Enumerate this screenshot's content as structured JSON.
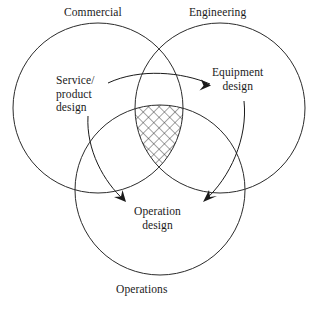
{
  "figure": {
    "type": "venn-diagram",
    "set_count": 3,
    "background_color": "#ffffff",
    "line_color": "#2b2b2b"
  },
  "circles": [
    {
      "id": "commercial",
      "label": "Commercial",
      "cx": 98,
      "cy": 108,
      "r": 85,
      "label_position": "top-left"
    },
    {
      "id": "engineering",
      "label": "Engineering",
      "cx": 220,
      "cy": 108,
      "r": 85,
      "label_position": "top-right"
    },
    {
      "id": "operations",
      "label": "Operations",
      "cx": 160,
      "cy": 190,
      "r": 85,
      "label_position": "bottom"
    }
  ],
  "labels": {
    "commercial": "Commercial",
    "engineering": "Engineering",
    "operations": "Operations"
  },
  "callouts": [
    {
      "id": "service-product-design",
      "lines": [
        "Service/",
        "product",
        "design"
      ],
      "line1": "Service/",
      "line2": "product",
      "line3": "design"
    },
    {
      "id": "equipment-design",
      "lines": [
        "Equipment",
        "design"
      ],
      "line1": "Equipment",
      "line2": "design"
    },
    {
      "id": "operation-design",
      "lines": [
        "Operation",
        "design"
      ],
      "line1": "Operation",
      "line2": "design"
    }
  ],
  "arrows": [
    {
      "id": "arrow-to-equipment-design",
      "from": "service-product-design-label",
      "to": "equipment-design-label",
      "direction": "right"
    },
    {
      "id": "arrow-service-to-operation-design",
      "from": "service-product-design-label",
      "to": "operation-design-label",
      "direction": "down-right"
    },
    {
      "id": "arrow-equipment-to-operation-design",
      "from": "equipment-design-label",
      "to": "operation-design-label",
      "direction": "down-left"
    }
  ],
  "hatched_region": {
    "id": "triple-intersection",
    "description": "cross-hatched intersection of all three circles",
    "pattern": "cross-hatch"
  }
}
